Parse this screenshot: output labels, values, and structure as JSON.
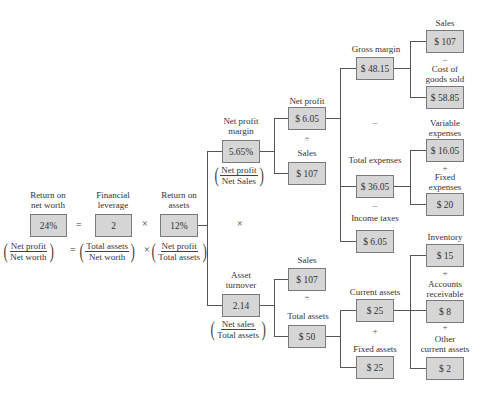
{
  "diagram": {
    "type": "DuPont financial ratio tree",
    "root": {
      "return_on_net_worth": {
        "label": "Return on\nnet worth",
        "label_l1": "Return on",
        "label_l2": "net worth",
        "value": "24%"
      },
      "financial_leverage": {
        "label_l1": "Financial",
        "label_l2": "leverage",
        "value": "2"
      },
      "return_on_assets": {
        "label_l1": "Return on",
        "label_l2": "assets",
        "value": "12%"
      },
      "eq_op": "=",
      "mult_op": "×",
      "formula": {
        "f1_num": "Net profit",
        "f1_den": "Net worth",
        "f2_num": "Total assets",
        "f2_den": "Net worth",
        "f3_num": "Net profit",
        "f3_den": "Total assets"
      }
    },
    "net_profit_margin": {
      "label_l1": "Net profit",
      "label_l2": "margin",
      "value": "5.65%",
      "f_num": "Net profit",
      "f_den": "Net Sales"
    },
    "asset_turnover": {
      "label_l1": "Asset",
      "label_l2": "turnover",
      "value": "2.14",
      "f_num": "Net sales",
      "f_den": "Total assets"
    },
    "between_branches_op": "×",
    "npm_children": {
      "net_profit": {
        "label": "Net profit",
        "value": "$ 6.05"
      },
      "op": "÷",
      "sales": {
        "label": "Sales",
        "value": "$ 107"
      }
    },
    "at_children": {
      "sales": {
        "label": "Sales",
        "value": "$ 107"
      },
      "op": "÷",
      "total_assets": {
        "label": "Total assets",
        "value": "$ 50"
      }
    },
    "net_profit_children": {
      "gross_margin": {
        "label": "Gross margin",
        "value": "$ 48.15"
      },
      "op1": "–",
      "total_expenses": {
        "label": "Total expenses",
        "value": "$ 36.05"
      },
      "op2": "–",
      "income_taxes": {
        "label": "Income taxes",
        "value": "$ 6.05"
      }
    },
    "gross_margin_children": {
      "sales": {
        "label": "Sales",
        "value": "$ 107"
      },
      "op": "–",
      "cogs": {
        "label_l1": "Cost of",
        "label_l2": "goods sold",
        "value": "$ 58.85"
      }
    },
    "total_expenses_children": {
      "variable": {
        "label_l1": "Variable",
        "label_l2": "expenses",
        "value": "$ 16.05"
      },
      "op": "+",
      "fixed": {
        "label_l1": "Fixed",
        "label_l2": "expenses",
        "value": "$ 20"
      }
    },
    "total_assets_children": {
      "current_assets": {
        "label": "Current assets",
        "value": "$ 25"
      },
      "op": "+",
      "fixed_assets": {
        "label": "Fixed assets",
        "value": "$ 25"
      }
    },
    "current_assets_children": {
      "inventory": {
        "label": "Inventory",
        "value": "$ 15"
      },
      "op1": "+",
      "ar": {
        "label_l1": "Accounts",
        "label_l2": "receivable",
        "value": "$ 8"
      },
      "op2": "+",
      "other": {
        "label_l1": "Other",
        "label_l2": "current assets",
        "value": "$ 2"
      }
    },
    "colors": {
      "box_fill": "#d6d6d6",
      "box_border": "#7a7a7a",
      "line": "#555555",
      "text": "#333333"
    }
  }
}
